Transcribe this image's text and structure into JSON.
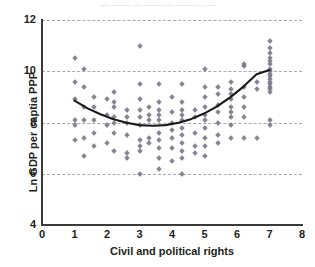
{
  "top_strip_text": "— — — — — — — — — — —",
  "axis": {
    "y_title": "Ln GDP per captia PPP",
    "x_title": "Civil and political rights",
    "y_ticks": [
      4,
      6,
      8,
      10,
      12
    ],
    "x_ticks": [
      0,
      1,
      2,
      3,
      4,
      5,
      6,
      7,
      8
    ]
  },
  "colors": {
    "marker": "#7d7a8c",
    "gridline": "#9a9aa6",
    "axis": "#3a3a3a",
    "trendline": "#1a1a1a",
    "text": "#231f20",
    "background": "#ffffff"
  },
  "chart_data": {
    "type": "scatter",
    "title": "",
    "xlabel": "Civil and political rights",
    "ylabel": "Ln GDP per captia PPP",
    "xlim": [
      0,
      8
    ],
    "ylim": [
      4,
      12
    ],
    "x_ticks": [
      0,
      1,
      2,
      3,
      4,
      5,
      6,
      7,
      8
    ],
    "y_ticks": [
      4,
      6,
      8,
      10,
      12
    ],
    "grid": "horizontal-dashed",
    "legend": "none",
    "marker": "diamond",
    "points": [
      [
        1.0,
        10.5
      ],
      [
        1.0,
        9.6
      ],
      [
        1.0,
        8.9
      ],
      [
        1.0,
        8.1
      ],
      [
        1.0,
        7.9
      ],
      [
        1.0,
        7.3
      ],
      [
        1.3,
        10.1
      ],
      [
        1.3,
        9.4
      ],
      [
        1.3,
        8.6
      ],
      [
        1.3,
        8.1
      ],
      [
        1.3,
        7.4
      ],
      [
        1.3,
        6.7
      ],
      [
        1.6,
        9.0
      ],
      [
        1.6,
        8.6
      ],
      [
        1.6,
        8.1
      ],
      [
        1.6,
        7.6
      ],
      [
        1.6,
        7.1
      ],
      [
        2.0,
        8.9
      ],
      [
        2.0,
        8.3
      ],
      [
        2.0,
        7.9
      ],
      [
        2.0,
        7.2
      ],
      [
        2.2,
        9.2
      ],
      [
        2.2,
        8.8
      ],
      [
        2.2,
        8.6
      ],
      [
        2.2,
        8.2
      ],
      [
        2.2,
        8.0
      ],
      [
        2.2,
        7.6
      ],
      [
        2.2,
        6.9
      ],
      [
        2.6,
        8.5
      ],
      [
        2.6,
        8.2
      ],
      [
        2.6,
        8.0
      ],
      [
        2.6,
        7.5
      ],
      [
        2.6,
        6.8
      ],
      [
        2.6,
        6.6
      ],
      [
        3.0,
        11.0
      ],
      [
        3.0,
        9.5
      ],
      [
        3.0,
        8.9
      ],
      [
        3.0,
        8.5
      ],
      [
        3.0,
        8.2
      ],
      [
        3.0,
        7.9
      ],
      [
        3.0,
        7.3
      ],
      [
        3.0,
        7.1
      ],
      [
        3.0,
        6.9
      ],
      [
        3.0,
        6.0
      ],
      [
        3.3,
        8.6
      ],
      [
        3.3,
        8.3
      ],
      [
        3.3,
        8.1
      ],
      [
        3.3,
        7.4
      ],
      [
        3.3,
        7.2
      ],
      [
        3.6,
        9.5
      ],
      [
        3.6,
        8.8
      ],
      [
        3.6,
        8.5
      ],
      [
        3.6,
        8.3
      ],
      [
        3.6,
        8.1
      ],
      [
        3.6,
        7.6
      ],
      [
        3.6,
        7.3
      ],
      [
        3.6,
        7.0
      ],
      [
        3.6,
        6.6
      ],
      [
        3.6,
        6.2
      ],
      [
        4.0,
        9.0
      ],
      [
        4.0,
        8.4
      ],
      [
        4.0,
        8.0
      ],
      [
        4.0,
        7.7
      ],
      [
        4.0,
        7.4
      ],
      [
        4.0,
        7.0
      ],
      [
        4.0,
        6.5
      ],
      [
        4.3,
        9.5
      ],
      [
        4.3,
        8.8
      ],
      [
        4.3,
        8.5
      ],
      [
        4.3,
        8.3
      ],
      [
        4.3,
        8.1
      ],
      [
        4.3,
        7.8
      ],
      [
        4.3,
        7.5
      ],
      [
        4.3,
        7.2
      ],
      [
        4.3,
        6.9
      ],
      [
        4.3,
        6.6
      ],
      [
        4.3,
        6.0
      ],
      [
        4.7,
        8.5
      ],
      [
        4.7,
        8.2
      ],
      [
        4.7,
        7.6
      ],
      [
        4.7,
        7.1
      ],
      [
        4.7,
        6.8
      ],
      [
        5.0,
        10.1
      ],
      [
        5.0,
        9.4
      ],
      [
        5.0,
        9.0
      ],
      [
        5.0,
        8.6
      ],
      [
        5.0,
        8.3
      ],
      [
        5.0,
        8.1
      ],
      [
        5.0,
        7.8
      ],
      [
        5.0,
        7.4
      ],
      [
        5.0,
        7.1
      ],
      [
        5.0,
        6.7
      ],
      [
        5.4,
        9.4
      ],
      [
        5.4,
        9.1
      ],
      [
        5.4,
        8.7
      ],
      [
        5.4,
        8.4
      ],
      [
        5.4,
        8.0
      ],
      [
        5.4,
        7.5
      ],
      [
        5.4,
        7.2
      ],
      [
        5.8,
        9.6
      ],
      [
        5.8,
        9.3
      ],
      [
        5.8,
        9.1
      ],
      [
        5.8,
        8.9
      ],
      [
        5.8,
        8.6
      ],
      [
        5.8,
        8.4
      ],
      [
        5.8,
        8.2
      ],
      [
        5.8,
        7.9
      ],
      [
        5.8,
        7.4
      ],
      [
        6.2,
        10.3
      ],
      [
        6.2,
        10.2
      ],
      [
        6.2,
        9.4
      ],
      [
        6.2,
        9.0
      ],
      [
        6.2,
        8.6
      ],
      [
        6.2,
        8.2
      ],
      [
        6.2,
        7.4
      ],
      [
        6.6,
        9.6
      ],
      [
        6.6,
        9.3
      ],
      [
        6.6,
        7.4
      ],
      [
        7.0,
        11.2
      ],
      [
        7.0,
        10.9
      ],
      [
        7.0,
        10.7
      ],
      [
        7.0,
        10.5
      ],
      [
        7.0,
        10.4
      ],
      [
        7.0,
        10.3
      ],
      [
        7.0,
        10.1
      ],
      [
        7.0,
        10.0
      ],
      [
        7.0,
        9.9
      ],
      [
        7.0,
        9.8
      ],
      [
        7.0,
        9.7
      ],
      [
        7.0,
        9.6
      ],
      [
        7.0,
        9.5
      ],
      [
        7.0,
        9.4
      ],
      [
        7.0,
        9.3
      ],
      [
        7.0,
        9.2
      ],
      [
        7.0,
        8.1
      ],
      [
        7.0,
        7.9
      ]
    ],
    "trendline": {
      "label": "quadratic fit",
      "points": [
        [
          1.0,
          8.85
        ],
        [
          1.4,
          8.55
        ],
        [
          1.8,
          8.32
        ],
        [
          2.2,
          8.13
        ],
        [
          2.6,
          7.99
        ],
        [
          3.0,
          7.9
        ],
        [
          3.4,
          7.87
        ],
        [
          3.8,
          7.9
        ],
        [
          4.2,
          7.99
        ],
        [
          4.6,
          8.14
        ],
        [
          5.0,
          8.36
        ],
        [
          5.4,
          8.64
        ],
        [
          5.8,
          8.99
        ],
        [
          6.2,
          9.4
        ],
        [
          6.6,
          9.88
        ],
        [
          7.0,
          10.05
        ]
      ]
    }
  }
}
